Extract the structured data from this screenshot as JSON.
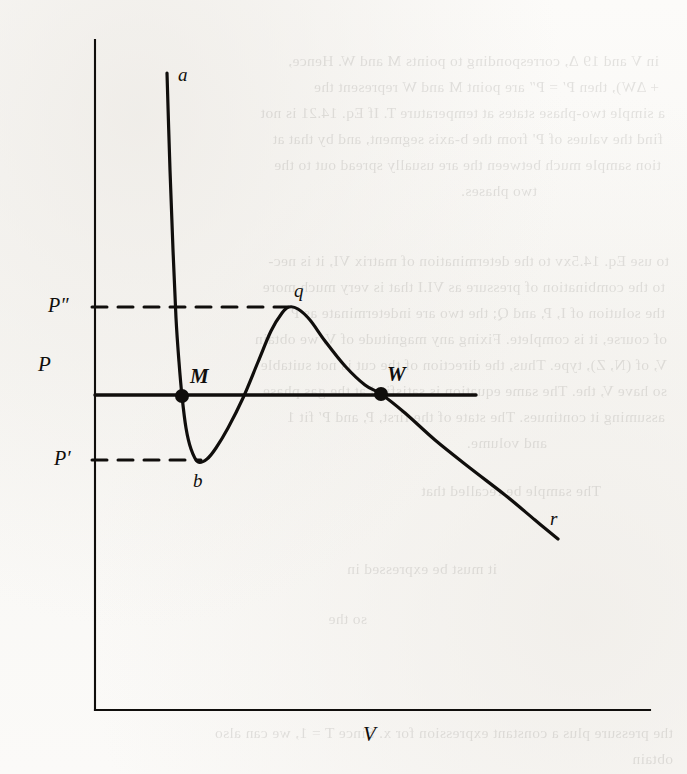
{
  "figure": {
    "kind": "pv-isotherm-diagram",
    "ink_color": "#100e0c",
    "paper_color": "#fbfaf8",
    "axis": {
      "y_label": "P",
      "x_label": "V"
    },
    "tick_labels": {
      "p_double_prime": "P″",
      "p_prime": "P′"
    },
    "curve_labels": {
      "start": "a",
      "minimum": "b",
      "maximum": "q",
      "end": "r"
    },
    "point_labels": {
      "left_intersection": "M",
      "right_intersection": "W"
    }
  },
  "chart_data": {
    "type": "line",
    "title": "",
    "xlabel": "V",
    "ylabel": "P",
    "grid": false,
    "legend": null,
    "axis_ranges": {
      "x": [
        0,
        1
      ],
      "y": [
        0,
        1
      ]
    },
    "series": [
      {
        "name": "van der Waals isotherm",
        "style": "solid",
        "width": 3.2,
        "points": [
          [
            167,
            73
          ],
          [
            170,
            170
          ],
          [
            173,
            250
          ],
          [
            176,
            318
          ],
          [
            179,
            362
          ],
          [
            182,
            396
          ],
          [
            186,
            428
          ],
          [
            191,
            449
          ],
          [
            198,
            462
          ],
          [
            207,
            459
          ],
          [
            216,
            448
          ],
          [
            228,
            428
          ],
          [
            243,
            398
          ],
          [
            258,
            362
          ],
          [
            271,
            331
          ],
          [
            282,
            313
          ],
          [
            289,
            307
          ],
          [
            298,
            309
          ],
          [
            310,
            320
          ],
          [
            325,
            341
          ],
          [
            345,
            366
          ],
          [
            365,
            385
          ],
          [
            381,
            394
          ],
          [
            405,
            413
          ],
          [
            435,
            440
          ],
          [
            470,
            468
          ],
          [
            505,
            495
          ],
          [
            535,
            520
          ],
          [
            558,
            539
          ]
        ]
      },
      {
        "name": "Maxwell equal-area horizontal line",
        "style": "solid",
        "width": 3.4,
        "points": [
          [
            95,
            395
          ],
          [
            476,
            395
          ]
        ]
      },
      {
        "name": "P-double-prime construction line",
        "style": "dashed",
        "width": 3.0,
        "points": [
          [
            92,
            307
          ],
          [
            288,
            307
          ]
        ]
      },
      {
        "name": "P-prime construction line",
        "style": "dashed",
        "width": 3.0,
        "points": [
          [
            92,
            460
          ],
          [
            201,
            460
          ]
        ]
      }
    ],
    "markers": [
      {
        "label": "M",
        "x": 182,
        "y": 396,
        "shape": "filled-circle",
        "radius": 7
      },
      {
        "label": "W",
        "x": 381,
        "y": 394,
        "shape": "filled-circle",
        "radius": 7
      }
    ],
    "annotations": [
      {
        "text": "a",
        "x": 178,
        "y": 64
      },
      {
        "text": "b",
        "x": 193,
        "y": 470
      },
      {
        "text": "q",
        "x": 294,
        "y": 280
      },
      {
        "text": "r",
        "x": 550,
        "y": 508
      },
      {
        "text": "M",
        "x": 190,
        "y": 364
      },
      {
        "text": "W",
        "x": 387,
        "y": 362
      },
      {
        "text": "P",
        "x": 38,
        "y": 352
      },
      {
        "text": "P″",
        "x": 48,
        "y": 294
      },
      {
        "text": "P′",
        "x": 54,
        "y": 447
      },
      {
        "text": "V",
        "x": 363,
        "y": 722
      }
    ],
    "axes_lines": {
      "y_axis": [
        [
          95,
          40
        ],
        [
          95,
          710
        ]
      ],
      "x_axis": [
        [
          95,
          710
        ],
        [
          650,
          710
        ]
      ]
    }
  },
  "background_bleed_through": {
    "note": "faint mirrored show-through text from reverse page",
    "lines": [
      {
        "text": "in V and 19 Δ, corresponding to points M and W. Hence,",
        "left": 28,
        "top": 48
      },
      {
        "text": "+ ΔW), then P′ = P″ are point M and W represent the",
        "left": 28,
        "top": 74
      },
      {
        "text": "a simple two-phase states at temperature T. If Eq. 14.21 is not",
        "left": 22,
        "top": 100
      },
      {
        "text": "find the values of P' from the b-axis segment, and by that at",
        "left": 24,
        "top": 126
      },
      {
        "text": "tion sample much between the are usually spread out to the",
        "left": 26,
        "top": 152
      },
      {
        "text": "two phases.",
        "left": 150,
        "top": 178
      },
      {
        "text": "to use Eq. 14.5xv to the determination of matrix VI, it is nec-",
        "left": 18,
        "top": 248
      },
      {
        "text": "to the combination of pressure as VI.I that is very much more",
        "left": 22,
        "top": 274
      },
      {
        "text": "the solution of I, P, and Q; the two are indeterminate as P",
        "left": 22,
        "top": 300
      },
      {
        "text": "of course, it is complete. Fixing any magnitude of V, we obtain",
        "left": 20,
        "top": 326
      },
      {
        "text": "V, of (N, Z), type. Thus, the direction of the cut is not suitable",
        "left": 20,
        "top": 352
      },
      {
        "text": "so have V, the. The same equation is satisfied at the gas phase",
        "left": 20,
        "top": 378
      },
      {
        "text": "assuming it continues. The state of the first, P, and P′ fit 1",
        "left": 22,
        "top": 404
      },
      {
        "text": "and volume.",
        "left": 140,
        "top": 430
      },
      {
        "text": "The sample be recalled that",
        "left": 86,
        "top": 478
      },
      {
        "text": "it must be expressed in",
        "left": 190,
        "top": 556
      },
      {
        "text": "so the",
        "left": 320,
        "top": 606
      },
      {
        "text": "the pressure plus a constant expression for x. Since T = 1, we can also",
        "left": 14,
        "top": 720
      },
      {
        "text": "obtain",
        "left": 14,
        "top": 746
      }
    ]
  }
}
